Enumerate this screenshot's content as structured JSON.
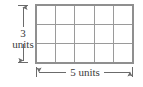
{
  "figure": {
    "grid": {
      "columns": 5,
      "rows": 3,
      "total_cells": 15,
      "line_color": "#9a9a9a",
      "fill_color": "#ffffff",
      "left": 36,
      "top": 5,
      "right": 133,
      "bottom": 63
    },
    "vertical_dimension": {
      "value": "3",
      "unit_label": "units",
      "full_label": "3 units",
      "arrow_color": "#6b6b6b",
      "axis_x": 23,
      "top_y": 5,
      "bottom_y": 63,
      "serif_half_width": 5
    },
    "horizontal_dimension": {
      "value": "5 units",
      "arrow_color": "#6b6b6b",
      "axis_y": 72,
      "left_x": 36,
      "right_x": 133,
      "serif_half_height": 5
    },
    "text_color": "#3a3a3a"
  }
}
